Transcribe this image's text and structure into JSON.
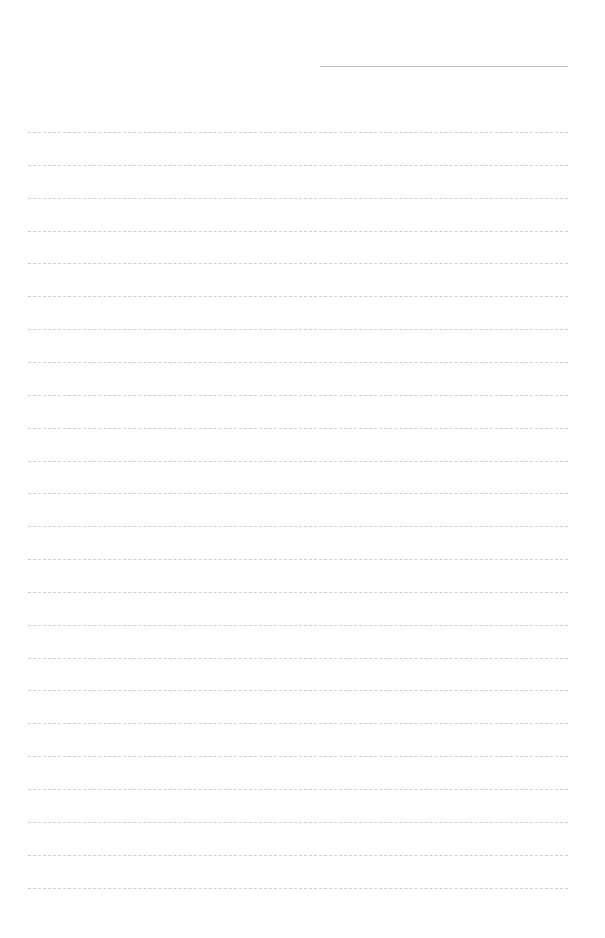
{
  "page": {
    "type": "lined-paper",
    "background": "#ffffff",
    "line_color": "#cfcfcf"
  },
  "header_line": {
    "x": 320,
    "y": 66,
    "width": 248,
    "label": ""
  },
  "ruled_lines": {
    "count": 24,
    "start_y": 132,
    "spacing": 32.85,
    "x": 28,
    "width": 540
  }
}
